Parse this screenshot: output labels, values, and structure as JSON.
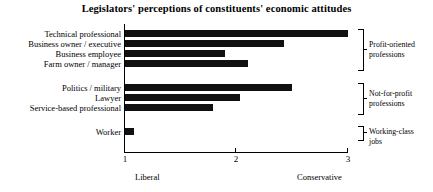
{
  "chart_data": {
    "type": "bar",
    "orientation": "horizontal",
    "title": "Legislators' perceptions of constituents' economic attitudes",
    "xlabel": "",
    "ylabel": "",
    "xlim": [
      1,
      3
    ],
    "xticks": [
      1,
      2,
      3
    ],
    "xtick_labels": [
      "1",
      "2",
      "3"
    ],
    "grid": false,
    "legend": "none",
    "axis_pole_labels": {
      "left": "Liberal",
      "right": "Conservative"
    },
    "categories": [
      "Technical professional",
      "Business owner / executive",
      "Business employee",
      "Farm owner / manager",
      "Politics / military",
      "Lawyer",
      "Service-based professional",
      "Worker"
    ],
    "values": [
      3.0,
      2.43,
      1.9,
      2.1,
      2.5,
      2.03,
      1.79,
      1.08
    ],
    "groups": [
      {
        "label": "Profit-oriented professions",
        "label_line1": "Profit-oriented",
        "label_line2": "professions",
        "members": [
          "Technical professional",
          "Business owner / executive",
          "Business employee",
          "Farm owner / manager"
        ]
      },
      {
        "label": "Not-for-profit professions",
        "label_line1": "Not-for-profit",
        "label_line2": "professions",
        "members": [
          "Politics / military",
          "Lawyer",
          "Service-based professional"
        ]
      },
      {
        "label": "Working-class jobs",
        "label_line1": "Working-class",
        "label_line2": "jobs",
        "members": [
          "Worker"
        ]
      }
    ],
    "bar_color": "#111111"
  }
}
